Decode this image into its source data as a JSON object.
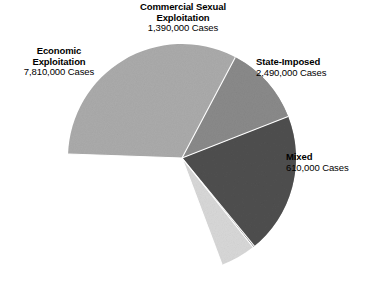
{
  "chart_data": {
    "type": "pie",
    "title": "",
    "subtitle": "",
    "unit": "Cases",
    "total": 12300000,
    "legend_position": "around-slices",
    "grid": false,
    "categories": [
      "Economic Exploitation",
      "State-Imposed",
      "Commercial Sexual Exploitation",
      "Mixed"
    ],
    "values": [
      7810000,
      2490000,
      1390000,
      610000
    ],
    "value_labels": [
      "7,810,000 Cases",
      "2,490,000 Cases",
      "1,390,000 Cases",
      "610,000 Cases"
    ],
    "percentages": [
      63.5,
      20.2,
      11.3,
      5.0
    ],
    "colors": [
      "#ababab",
      "#4f4f4f",
      "#8a8a8a",
      "#d8d8d8"
    ],
    "slices": [
      {
        "name": "Economic Exploitation",
        "label_line1": "Economic",
        "label_line2": "Exploitation",
        "value_label": "7,810,000 Cases",
        "value": 7810000,
        "percent": 63.5,
        "color": "#ababab",
        "start_angle_deg": 182,
        "end_angle_deg": 410.6
      },
      {
        "name": "State-Imposed",
        "label_line1": "State-Imposed",
        "label_line2": "",
        "value_label": "2,490,000 Cases",
        "value": 2490000,
        "percent": 20.2,
        "color": "#4f4f4f",
        "start_angle_deg": 338.6,
        "end_angle_deg": 411.4
      },
      {
        "name": "Commercial Sexual Exploitation",
        "label_line1": "Commercial Sexual",
        "label_line2": "Exploitation",
        "value_label": "1,390,000 Cases",
        "value": 1390000,
        "percent": 11.3,
        "color": "#8a8a8a",
        "start_angle_deg": 297.9,
        "end_angle_deg": 338.6
      },
      {
        "name": "Mixed",
        "label_line1": "Mixed",
        "label_line2": "",
        "value_label": "610,000 Cases",
        "value": 610000,
        "percent": 5.0,
        "color": "#d8d8d8",
        "start_angle_deg": 411.4,
        "end_angle_deg": 429.4
      }
    ],
    "geometry": {
      "center_x": 182,
      "center_y": 158,
      "radius": 114,
      "separator_color": "#ffffff",
      "separator_width": 1.1
    }
  },
  "labels": {
    "cse": {
      "line1": "Commercial Sexual",
      "line2": "Exploitation",
      "value": "1,390,000 Cases"
    },
    "economic": {
      "line1": "Economic",
      "line2": "Exploitation",
      "value": "7,810,000 Cases"
    },
    "state": {
      "line1": "State-Imposed",
      "value": "2,490,000 Cases"
    },
    "mixed": {
      "line1": "Mixed",
      "value": "610,000 Cases"
    }
  }
}
